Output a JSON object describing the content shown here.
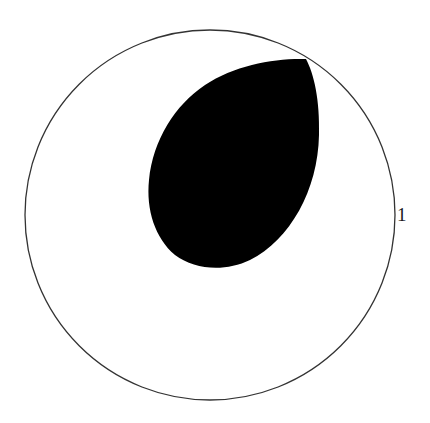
{
  "diagram": {
    "type": "polar-region",
    "unit_circle": {
      "center": [
        210,
        215
      ],
      "radius": 185,
      "stroke": "#333333",
      "label": "1"
    },
    "lobe": {
      "fill": "#000000",
      "tip_point": [
        306,
        59
      ]
    },
    "colors": {
      "background": "#ffffff",
      "outline": "#333333",
      "fill": "#000000"
    }
  }
}
